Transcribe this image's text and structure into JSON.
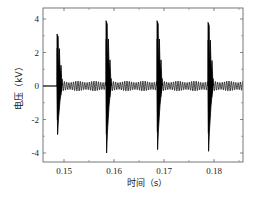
{
  "chart_data": {
    "type": "line",
    "title": "",
    "xlabel": "时间（s）",
    "ylabel": "电压（kV）",
    "xlim": [
      0.1458,
      0.1858
    ],
    "ylim": [
      -4.6,
      4.6
    ],
    "x_ticks": [
      0.15,
      0.16,
      0.17,
      0.18
    ],
    "x_tick_labels": [
      "0.15",
      "0.16",
      "0.17",
      "0.18"
    ],
    "x_minor_ticks": [
      0.155,
      0.165,
      0.175,
      0.185
    ],
    "y_ticks": [
      4,
      2,
      0,
      -2,
      -4
    ],
    "y_tick_labels": [
      "4",
      "2",
      "0",
      "-2",
      "-4"
    ],
    "grid": false,
    "legend": null,
    "line_color": "#000000",
    "series": [
      {
        "name": "voltage",
        "baseline_before_first_pulse": 0,
        "ripple_amplitude_kV": 0.3,
        "pulses": [
          {
            "t": 0.1486,
            "peak_pos_kV": 3.1,
            "peak_neg_kV": -2.9
          },
          {
            "t": 0.1584,
            "peak_pos_kV": 3.9,
            "peak_neg_kV": -4.0
          },
          {
            "t": 0.1686,
            "peak_pos_kV": 3.9,
            "peak_neg_kV": -3.8
          },
          {
            "t": 0.1788,
            "peak_pos_kV": 3.8,
            "peak_neg_kV": -3.9
          }
        ]
      }
    ]
  }
}
